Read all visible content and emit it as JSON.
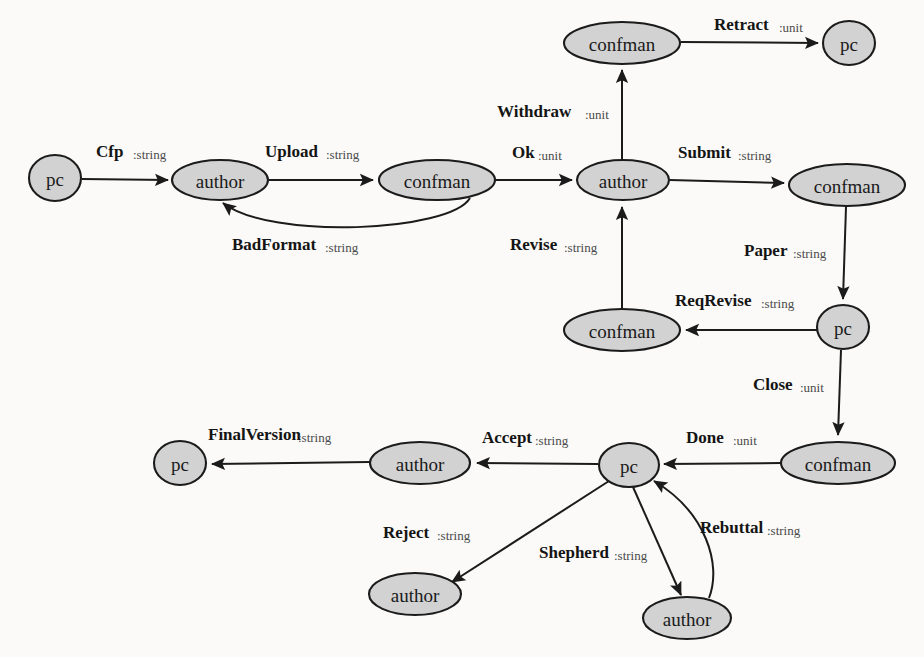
{
  "diagram": {
    "background_color": "#fbfaf8",
    "node_fill_color": "#d2d2d2",
    "node_stroke_color": "#1b1b1b",
    "edge_color": "#1b1b1b",
    "nodes": [
      {
        "id": "pc-cfp",
        "label": "pc",
        "cx": 55,
        "cy": 178,
        "rx": 26,
        "ry": 23
      },
      {
        "id": "author-upload",
        "label": "author",
        "cx": 220,
        "cy": 180,
        "rx": 48,
        "ry": 20
      },
      {
        "id": "confman-ok",
        "label": "confman",
        "cx": 437,
        "cy": 180,
        "rx": 58,
        "ry": 20
      },
      {
        "id": "author-main",
        "label": "author",
        "cx": 623,
        "cy": 180,
        "rx": 46,
        "ry": 20
      },
      {
        "id": "confman-retract",
        "label": "confman",
        "cx": 622,
        "cy": 43,
        "rx": 58,
        "ry": 21
      },
      {
        "id": "pc-retract",
        "label": "pc",
        "cx": 849,
        "cy": 43,
        "rx": 26,
        "ry": 22
      },
      {
        "id": "confman-submit",
        "label": "confman",
        "cx": 847,
        "cy": 185,
        "rx": 58,
        "ry": 21
      },
      {
        "id": "pc-paper",
        "label": "pc",
        "cx": 843,
        "cy": 327,
        "rx": 26,
        "ry": 22
      },
      {
        "id": "confman-revise",
        "label": "confman",
        "cx": 622,
        "cy": 330,
        "rx": 58,
        "ry": 21
      },
      {
        "id": "confman-done",
        "label": "confman",
        "cx": 838,
        "cy": 463,
        "rx": 57,
        "ry": 21
      },
      {
        "id": "pc-decision",
        "label": "pc",
        "cx": 629,
        "cy": 465,
        "rx": 30,
        "ry": 22
      },
      {
        "id": "author-accept",
        "label": "author",
        "cx": 420,
        "cy": 463,
        "rx": 50,
        "ry": 21
      },
      {
        "id": "pc-final",
        "label": "pc",
        "cx": 180,
        "cy": 463,
        "rx": 26,
        "ry": 22
      },
      {
        "id": "author-reject",
        "label": "author",
        "cx": 415,
        "cy": 594,
        "rx": 46,
        "ry": 21
      },
      {
        "id": "author-shepherd",
        "label": "author",
        "cx": 687,
        "cy": 618,
        "rx": 44,
        "ry": 21
      }
    ],
    "edges": [
      {
        "id": "cfp",
        "name": "Cfp",
        "type": ":string",
        "from": "pc-cfp",
        "to": "author-upload",
        "name_x": 96,
        "name_y": 157,
        "type_x": 133,
        "type_y": 159
      },
      {
        "id": "upload",
        "name": "Upload",
        "type": ":string",
        "from": "author-upload",
        "to": "confman-ok",
        "name_x": 265,
        "name_y": 157,
        "type_x": 326,
        "type_y": 159
      },
      {
        "id": "badformat",
        "name": "BadFormat",
        "type": ":string",
        "from": "confman-ok",
        "to": "author-upload",
        "name_x": 232,
        "name_y": 250,
        "type_x": 325,
        "type_y": 252
      },
      {
        "id": "ok",
        "name": "Ok",
        "type": ":unit",
        "from": "confman-ok",
        "to": "author-main",
        "name_x": 512,
        "name_y": 158,
        "type_x": 538,
        "type_y": 160
      },
      {
        "id": "withdraw",
        "name": "Withdraw",
        "type": ":unit",
        "from": "author-main",
        "to": "confman-retract",
        "name_x": 497,
        "name_y": 117,
        "type_x": 585,
        "type_y": 119
      },
      {
        "id": "retract",
        "name": "Retract",
        "type": ":unit",
        "from": "confman-retract",
        "to": "pc-retract",
        "name_x": 714,
        "name_y": 30,
        "type_x": 779,
        "type_y": 32
      },
      {
        "id": "submit",
        "name": "Submit",
        "type": ":string",
        "from": "author-main",
        "to": "confman-submit",
        "name_x": 678,
        "name_y": 158,
        "type_x": 738,
        "type_y": 160
      },
      {
        "id": "paper",
        "name": "Paper",
        "type": ":string",
        "from": "confman-submit",
        "to": "pc-paper",
        "name_x": 744,
        "name_y": 256,
        "type_x": 793,
        "type_y": 258
      },
      {
        "id": "reqrevise",
        "name": "ReqRevise",
        "type": ":string",
        "from": "pc-paper",
        "to": "confman-revise",
        "name_x": 675,
        "name_y": 306,
        "type_x": 761,
        "type_y": 308
      },
      {
        "id": "revise",
        "name": "Revise",
        "type": ":string",
        "from": "confman-revise",
        "to": "author-main",
        "name_x": 510,
        "name_y": 250,
        "type_x": 564,
        "type_y": 252
      },
      {
        "id": "close",
        "name": "Close",
        "type": ":unit",
        "from": "pc-paper",
        "to": "confman-done",
        "name_x": 753,
        "name_y": 390,
        "type_x": 800,
        "type_y": 392
      },
      {
        "id": "done",
        "name": "Done",
        "type": ":unit",
        "from": "confman-done",
        "to": "pc-decision",
        "name_x": 686,
        "name_y": 443,
        "type_x": 733,
        "type_y": 445
      },
      {
        "id": "accept",
        "name": "Accept",
        "type": ":string",
        "from": "pc-decision",
        "to": "author-accept",
        "name_x": 482,
        "name_y": 443,
        "type_x": 535,
        "type_y": 445
      },
      {
        "id": "finalversion",
        "name": "FinalVersion",
        "type": ":string",
        "from": "author-accept",
        "to": "pc-final",
        "name_x": 208,
        "name_y": 440,
        "type_x": 298,
        "type_y": 442
      },
      {
        "id": "reject",
        "name": "Reject",
        "type": ":string",
        "from": "pc-decision",
        "to": "author-reject",
        "name_x": 383,
        "name_y": 538,
        "type_x": 437,
        "type_y": 540
      },
      {
        "id": "shepherd",
        "name": "Shepherd",
        "type": ":string",
        "from": "pc-decision",
        "to": "author-shepherd",
        "name_x": 539,
        "name_y": 558,
        "type_x": 614,
        "type_y": 560
      },
      {
        "id": "rebuttal",
        "name": "Rebuttal",
        "type": ":string",
        "from": "author-shepherd",
        "to": "pc-decision",
        "name_x": 700,
        "name_y": 533,
        "type_x": 767,
        "type_y": 535
      }
    ]
  }
}
